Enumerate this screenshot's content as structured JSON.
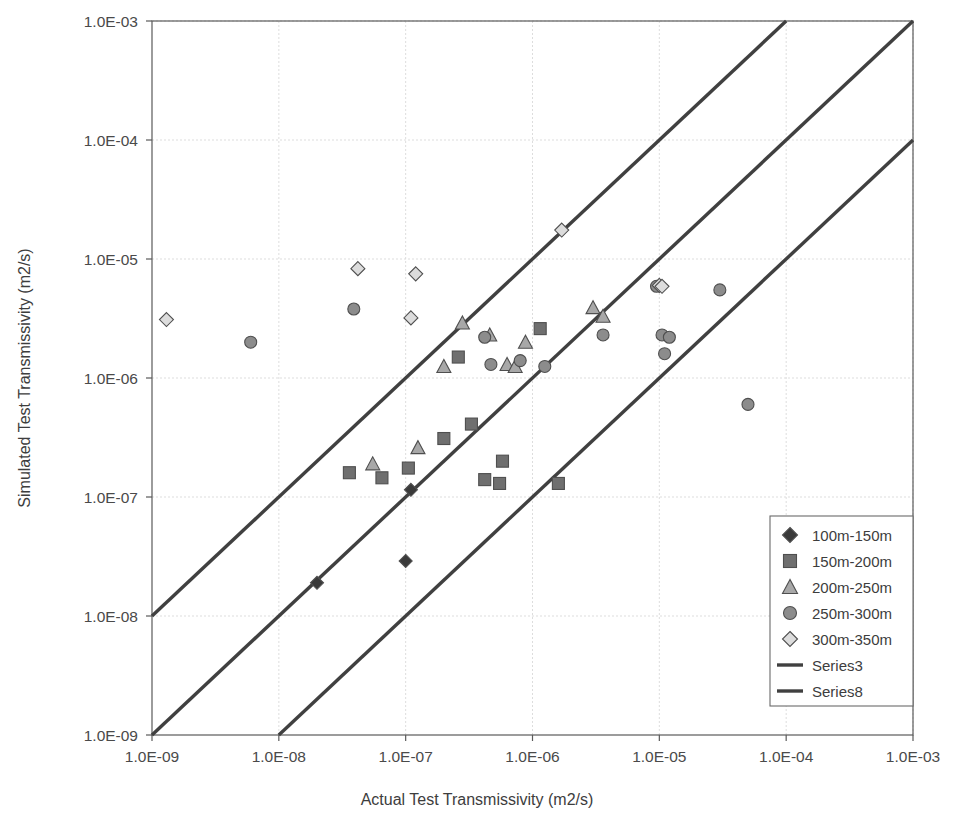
{
  "chart_data": {
    "type": "scatter",
    "title": "",
    "xlabel": "Actual Test Transmissivity (m2/s)",
    "ylabel": "Simulated Test Transmissivity (m2/s)",
    "xscale": "log",
    "yscale": "log",
    "xlim": [
      1e-09,
      0.001
    ],
    "ylim": [
      1e-09,
      0.001
    ],
    "grid": true,
    "legend_position": "bottom-right",
    "xticks": [
      "1.0E-09",
      "1.0E-08",
      "1.0E-07",
      "1.0E-06",
      "1.0E-05",
      "1.0E-04",
      "1.0E-03"
    ],
    "yticks": [
      "1.0E-09",
      "1.0E-08",
      "1.0E-07",
      "1.0E-06",
      "1.0E-05",
      "1.0E-04",
      "1.0E-03"
    ],
    "xtick_values": [
      1e-09,
      1e-08,
      1e-07,
      1e-06,
      1e-05,
      0.0001,
      0.001
    ],
    "ytick_values": [
      1e-09,
      1e-08,
      1e-07,
      1e-06,
      1e-05,
      0.0001,
      0.001
    ],
    "series": [
      {
        "name": "100m-150m",
        "marker": "diamond",
        "color": "#3a3a3a",
        "size": 11,
        "points": [
          [
            2e-08,
            1.9e-08
          ],
          [
            1e-07,
            2.9e-08
          ],
          [
            1.1e-07,
            1.15e-07
          ]
        ]
      },
      {
        "name": "150m-200m",
        "marker": "square",
        "color": "#6f6f6f",
        "size": 12,
        "points": [
          [
            3.6e-08,
            1.6e-07
          ],
          [
            6.5e-08,
            1.45e-07
          ],
          [
            1.05e-07,
            1.75e-07
          ],
          [
            2e-07,
            3.1e-07
          ],
          [
            2.6e-07,
            1.5e-06
          ],
          [
            3.3e-07,
            4.1e-07
          ],
          [
            4.2e-07,
            1.4e-07
          ],
          [
            5.5e-07,
            1.3e-07
          ],
          [
            5.8e-07,
            2e-07
          ],
          [
            1.15e-06,
            2.6e-06
          ],
          [
            1.6e-06,
            1.3e-07
          ]
        ]
      },
      {
        "name": "200m-250m",
        "marker": "triangle",
        "color": "#a8a8a8",
        "size": 12,
        "points": [
          [
            5.5e-08,
            1.9e-07
          ],
          [
            1.25e-07,
            2.6e-07
          ],
          [
            2e-07,
            1.25e-06
          ],
          [
            2.8e-07,
            2.9e-06
          ],
          [
            4.6e-07,
            2.3e-06
          ],
          [
            6.3e-07,
            1.3e-06
          ],
          [
            7.3e-07,
            1.25e-06
          ],
          [
            8.8e-07,
            2e-06
          ],
          [
            3e-06,
            3.9e-06
          ],
          [
            3.6e-06,
            3.3e-06
          ]
        ]
      },
      {
        "name": "250m-300m",
        "marker": "circle",
        "color": "#8c8c8c",
        "size": 12,
        "points": [
          [
            6e-09,
            2e-06
          ],
          [
            3.9e-08,
            3.8e-06
          ],
          [
            4.2e-07,
            2.2e-06
          ],
          [
            4.7e-07,
            1.3e-06
          ],
          [
            8e-07,
            1.4e-06
          ],
          [
            1.25e-06,
            1.25e-06
          ],
          [
            3.6e-06,
            2.3e-06
          ],
          [
            9.5e-06,
            5.9e-06
          ],
          [
            1.05e-05,
            2.3e-06
          ],
          [
            1.2e-05,
            2.2e-06
          ],
          [
            1.1e-05,
            1.6e-06
          ],
          [
            3e-05,
            5.5e-06
          ],
          [
            5e-05,
            6e-07
          ]
        ]
      },
      {
        "name": "300m-350m",
        "marker": "diamond-light",
        "color": "#dcdcdc",
        "size": 12,
        "points": [
          [
            1.3e-09,
            3.1e-06
          ],
          [
            4.2e-08,
            8.3e-06
          ],
          [
            1.2e-07,
            7.5e-06
          ],
          [
            1.1e-07,
            3.2e-06
          ],
          [
            1.7e-06,
            1.75e-05
          ],
          [
            1e-05,
            6e-06
          ],
          [
            1.05e-05,
            5.9e-06
          ]
        ]
      }
    ],
    "reference_lines": [
      {
        "name": "Series3",
        "label": "Series3",
        "comment": "upper envelope, 10x simulated over actual",
        "from": [
          1e-09,
          1e-08
        ],
        "to": [
          0.0001,
          0.001
        ]
      },
      {
        "name": "Series1",
        "label": "",
        "comment": "1:1 line",
        "from": [
          1e-09,
          1e-09
        ],
        "to": [
          0.001,
          0.001
        ]
      },
      {
        "name": "Series8",
        "label": "Series8",
        "comment": "lower envelope, 10x actual over simulated",
        "from": [
          1e-08,
          1e-09
        ],
        "to": [
          0.001,
          0.0001
        ]
      }
    ],
    "legend_entries": [
      {
        "label": "100m-150m",
        "marker": "diamond",
        "color": "#3a3a3a"
      },
      {
        "label": "150m-200m",
        "marker": "square",
        "color": "#6f6f6f"
      },
      {
        "label": "200m-250m",
        "marker": "triangle",
        "color": "#a8a8a8"
      },
      {
        "label": "250m-300m",
        "marker": "circle",
        "color": "#8c8c8c"
      },
      {
        "label": "300m-350m",
        "marker": "diamond-light",
        "color": "#dcdcdc"
      },
      {
        "label": "Series3",
        "marker": "line",
        "color": "#404040"
      },
      {
        "label": "Series8",
        "marker": "line",
        "color": "#404040"
      }
    ]
  }
}
